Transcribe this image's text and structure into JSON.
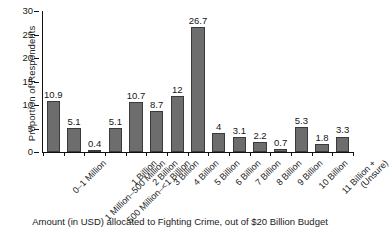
{
  "chart_data": {
    "type": "bar",
    "title": "",
    "xlabel": "Amount (in USD) allocated to Fighting Crime, out of $20 Billion Budget",
    "ylabel": "Proportion of Respondents",
    "ylim": [
      0,
      30
    ],
    "yticks": [
      0,
      5,
      10,
      15,
      20,
      25,
      30
    ],
    "grid": false,
    "legend": "none",
    "bar_color": "#6d6d6d",
    "bar_edge_color": "#3a3a3a",
    "categories": [
      "0–1 Million",
      "1 Million–500 Million",
      "500 Million–<1 Billion",
      "1 Billion",
      "2 Billion",
      "3 Billion",
      "4 Billion",
      "5 Billion",
      "6 Billion",
      "7 Billion",
      "8 Billion",
      "9 Billion",
      "10 Billion",
      "11 Billion +",
      "(Unsure)"
    ],
    "values": [
      10.9,
      5.1,
      0.4,
      5.1,
      10.7,
      8.7,
      12,
      26.7,
      4,
      3.1,
      2.2,
      0.7,
      5.3,
      1.8,
      3.3
    ],
    "value_labels": [
      "10.9",
      "5.1",
      "0.4",
      "5.1",
      "10.7",
      "8.7",
      "12",
      "26.7",
      "4",
      "3.1",
      "2.2",
      "0.7",
      "5.3",
      "1.8",
      "3.3"
    ]
  }
}
